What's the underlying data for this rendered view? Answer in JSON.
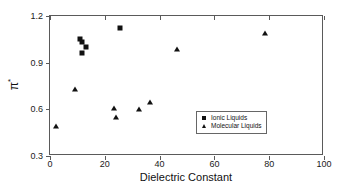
{
  "chart_data": {
    "type": "scatter",
    "title": "",
    "xlabel": "Dielectric Constant",
    "ylabel": "π*",
    "xlim": [
      0,
      100
    ],
    "ylim": [
      0.3,
      1.2
    ],
    "xticks": [
      0,
      20,
      40,
      60,
      80,
      100
    ],
    "yticks": [
      0.3,
      0.6,
      0.9,
      1.2
    ],
    "xtick_labels": [
      "0",
      "20",
      "40",
      "60",
      "80",
      "100"
    ],
    "ytick_labels": [
      "0.3",
      "0.6",
      "0.9",
      "1.2"
    ],
    "grid": false,
    "legend_position": "center-right",
    "series": [
      {
        "name": "Ionic Liquids",
        "marker": "square",
        "color": "#111111",
        "points": [
          {
            "x": 11.0,
            "y": 1.05
          },
          {
            "x": 11.5,
            "y": 1.03
          },
          {
            "x": 11.5,
            "y": 0.96
          },
          {
            "x": 13.0,
            "y": 1.0
          },
          {
            "x": 25.5,
            "y": 1.12
          }
        ]
      },
      {
        "name": "Molecular Liquids",
        "marker": "triangle",
        "color": "#111111",
        "points": [
          {
            "x": 2.3,
            "y": 0.49
          },
          {
            "x": 9.0,
            "y": 0.73
          },
          {
            "x": 23.5,
            "y": 0.61
          },
          {
            "x": 24.0,
            "y": 0.55
          },
          {
            "x": 32.5,
            "y": 0.6
          },
          {
            "x": 36.5,
            "y": 0.65
          },
          {
            "x": 46.5,
            "y": 0.99
          },
          {
            "x": 78.5,
            "y": 1.09
          }
        ]
      }
    ]
  },
  "legend": {
    "entries": [
      {
        "label": "Ionic Liquids",
        "marker": "square"
      },
      {
        "label": "Molecular Liquids",
        "marker": "triangle"
      }
    ]
  }
}
